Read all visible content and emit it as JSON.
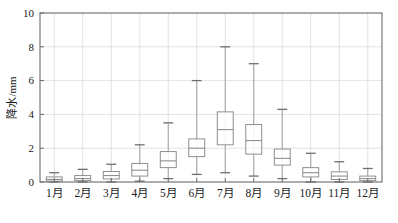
{
  "chart_data": {
    "type": "box",
    "title": "",
    "subtitle": "",
    "xlabel": "",
    "ylabel": "降水/mm",
    "ylim": [
      0,
      10
    ],
    "ytick_values": [
      0,
      2,
      4,
      6,
      8,
      10
    ],
    "ytick_labels": [
      "0",
      "2",
      "4",
      "6",
      "8",
      "10"
    ],
    "grid": true,
    "grid_axis": "both",
    "legend": "none",
    "categories": [
      "1月",
      "2月",
      "3月",
      "4月",
      "5月",
      "6月",
      "7月",
      "8月",
      "9月",
      "10月",
      "11月",
      "12月"
    ],
    "boxes": [
      {
        "category": "1月",
        "whisker_low": 0.0,
        "q1": 0.05,
        "median": 0.15,
        "q3": 0.3,
        "whisker_high": 0.55
      },
      {
        "category": "2月",
        "whisker_low": 0.0,
        "q1": 0.08,
        "median": 0.2,
        "q3": 0.38,
        "whisker_high": 0.75
      },
      {
        "category": "3月",
        "whisker_low": 0.0,
        "q1": 0.18,
        "median": 0.38,
        "q3": 0.62,
        "whisker_high": 1.05
      },
      {
        "category": "4月",
        "whisker_low": 0.05,
        "q1": 0.35,
        "median": 0.7,
        "q3": 1.1,
        "whisker_high": 2.2
      },
      {
        "category": "5月",
        "whisker_low": 0.2,
        "q1": 0.85,
        "median": 1.25,
        "q3": 1.8,
        "whisker_high": 3.5
      },
      {
        "category": "6月",
        "whisker_low": 0.45,
        "q1": 1.5,
        "median": 2.0,
        "q3": 2.55,
        "whisker_high": 6.0
      },
      {
        "category": "7月",
        "whisker_low": 0.55,
        "q1": 2.2,
        "median": 3.1,
        "q3": 4.15,
        "whisker_high": 8.0
      },
      {
        "category": "8月",
        "whisker_low": 0.35,
        "q1": 1.65,
        "median": 2.45,
        "q3": 3.4,
        "whisker_high": 7.0
      },
      {
        "category": "9月",
        "whisker_low": 0.2,
        "q1": 1.0,
        "median": 1.4,
        "q3": 1.95,
        "whisker_high": 4.3
      },
      {
        "category": "10月",
        "whisker_low": 0.0,
        "q1": 0.3,
        "median": 0.55,
        "q3": 0.85,
        "whisker_high": 1.7
      },
      {
        "category": "11月",
        "whisker_low": 0.0,
        "q1": 0.15,
        "median": 0.35,
        "q3": 0.6,
        "whisker_high": 1.2
      },
      {
        "category": "12月",
        "whisker_low": 0.0,
        "q1": 0.08,
        "median": 0.2,
        "q3": 0.35,
        "whisker_high": 0.8
      }
    ]
  },
  "colors": {
    "box_stroke": "#8a8a8a",
    "median_stroke": "#8a8a8a",
    "whisker_stroke": "#9a9a9a",
    "cap_stroke": "#6f6f6f",
    "grid": "#dcdcdc",
    "frame": "#6b6b6b",
    "axis_text": "#1a1a1a",
    "background": "#ffffff"
  },
  "plot_geometry": {
    "left": 40,
    "right": 382,
    "top": 13,
    "bottom": 182
  }
}
